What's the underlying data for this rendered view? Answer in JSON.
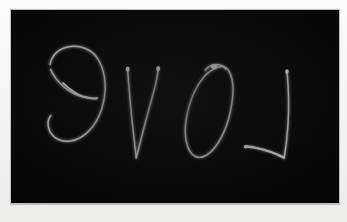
{
  "scene": {
    "width": 347,
    "height": 222,
    "paper_color": "#f3f2f0",
    "board_color": "#050505",
    "board_edge_color": "#bdbdbd",
    "ink_color": "#d2d2d2",
    "ink_highlight_color": "#f0f0f0"
  },
  "board": {
    "label": "chalkboard-panel",
    "x": 11,
    "y": 10,
    "width": 328,
    "height": 193
  },
  "handwriting": {
    "text_as_written": "ƎVO⅃",
    "reads_as": "LOVE",
    "reading_direction": "right-to-left (mirror image)",
    "stroke_color": "#d2d2d2",
    "stroke_style": "thin handwritten line with pen-start blobs",
    "glyphs": [
      {
        "name": "glyph-e-mirrored",
        "letter": "E",
        "rendered": "mirrored lowercase e",
        "order_in_word": 4,
        "x": 46,
        "y": 68,
        "width": 59,
        "height": 80
      },
      {
        "name": "glyph-v",
        "letter": "V",
        "rendered": "V",
        "order_in_word": 3,
        "x": 126,
        "y": 68,
        "width": 31,
        "height": 90
      },
      {
        "name": "glyph-o",
        "letter": "O",
        "rendered": "slanted O with top hook",
        "order_in_word": 2,
        "x": 185,
        "y": 67,
        "width": 43,
        "height": 91
      },
      {
        "name": "glyph-l-mirrored",
        "letter": "L",
        "rendered": "mirrored L",
        "order_in_word": 1,
        "x": 246,
        "y": 71,
        "width": 42,
        "height": 90
      }
    ]
  }
}
